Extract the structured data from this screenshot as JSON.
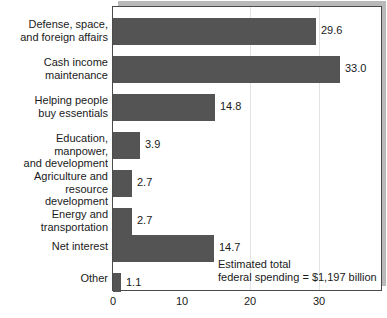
{
  "chart_data": {
    "type": "bar",
    "orientation": "horizontal",
    "title": "",
    "xlabel": "",
    "ylabel": "",
    "categories": [
      "Defense, space,\nand foreign affairs",
      "Cash income\nmaintenance",
      "Helping people\nbuy essentials",
      "Education, manpower,\nand development",
      "Agriculture and resource\ndevelopment",
      "Energy and\ntransportation",
      "Net interest",
      "Other"
    ],
    "values": [
      29.6,
      33.0,
      14.8,
      3.9,
      2.7,
      2.7,
      14.7,
      1.1
    ],
    "value_labels": [
      "29.6",
      "33.0",
      "14.8",
      "3.9",
      "2.7",
      "2.7",
      "14.7",
      "1.1"
    ],
    "xticks": [
      0,
      10,
      20,
      30
    ],
    "xtick_labels": [
      "0",
      "10",
      "20",
      "30"
    ],
    "xlim": [
      0,
      39
    ],
    "grid": "vertical-faint",
    "legend": "none",
    "bar_color": "#545454",
    "frame_color": "#4a4a4a",
    "shadow_color": "#b9b9b9",
    "annotation": "Estimated total\nfederal spending = $1,197 billion"
  }
}
